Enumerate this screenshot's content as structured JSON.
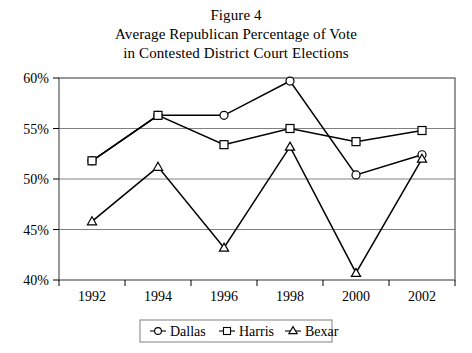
{
  "figure": {
    "title_lines": [
      "Figure 4",
      "Average Republican Percentage of Vote",
      "in Contested District Court Elections"
    ]
  },
  "axes": {
    "y_ticks": [
      "40%",
      "45%",
      "50%",
      "55%",
      "60%"
    ],
    "x_ticks": [
      "1992",
      "1994",
      "1996",
      "1998",
      "2000",
      "2002"
    ]
  },
  "legend": {
    "items": [
      {
        "label": "Dallas",
        "marker": "circle-marker"
      },
      {
        "label": "Harris",
        "marker": "square-marker"
      },
      {
        "label": "Bexar",
        "marker": "triangle-marker"
      }
    ]
  },
  "colors": {
    "line": "#000000",
    "grid": "#808080",
    "axis": "#000000",
    "marker_fill": "#ffffff",
    "background": "#ffffff"
  },
  "chart_data": {
    "type": "line",
    "xlabel": "",
    "ylabel": "",
    "categories": [
      "1992",
      "1994",
      "1996",
      "1998",
      "2000",
      "2002"
    ],
    "x": [
      1992,
      1994,
      1996,
      1998,
      2000,
      2002
    ],
    "ylim": [
      40,
      60
    ],
    "ytick_values": [
      40,
      45,
      50,
      55,
      60
    ],
    "ytick_format": "percent",
    "grid": true,
    "legend_position": "bottom-center",
    "series": [
      {
        "name": "Dallas",
        "marker": "circle",
        "values": [
          51.8,
          56.3,
          56.3,
          59.7,
          50.4,
          52.4
        ]
      },
      {
        "name": "Harris",
        "marker": "square",
        "values": [
          51.8,
          56.3,
          53.4,
          55.0,
          53.7,
          54.8
        ]
      },
      {
        "name": "Bexar",
        "marker": "triangle",
        "values": [
          45.8,
          51.2,
          43.2,
          53.2,
          40.7,
          52.0
        ]
      }
    ]
  }
}
